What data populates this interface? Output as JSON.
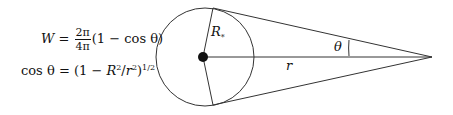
{
  "equations": {
    "w_lhs": "W",
    "w_eq": " = ",
    "w_num": "2π",
    "w_den": "4π",
    "w_rhs": "(1 − cos θ)",
    "cos_lhs": "cos θ",
    "cos_eq": " = (1 − ",
    "cos_R": "R",
    "cos_R_sub": "*",
    "cos_R_sup": "2",
    "cos_slash": "/",
    "cos_r": "r",
    "cos_r_sup": "2",
    "cos_close": ")",
    "cos_exp": "1/2"
  },
  "labels": {
    "radius_star": "R",
    "radius_star_sub": "*",
    "distance": "r",
    "angle": "θ"
  },
  "geometry": {
    "circle": {
      "cx": 205,
      "cy": 57,
      "r": 49
    },
    "center_dot": {
      "cx": 203,
      "cy": 57,
      "r": 5
    },
    "apex": {
      "x": 432,
      "y": 57
    },
    "tangent_top": {
      "x": 213,
      "y": 8
    },
    "tangent_bottom": {
      "x": 213,
      "y": 105
    },
    "stroke_color": "#333333"
  }
}
